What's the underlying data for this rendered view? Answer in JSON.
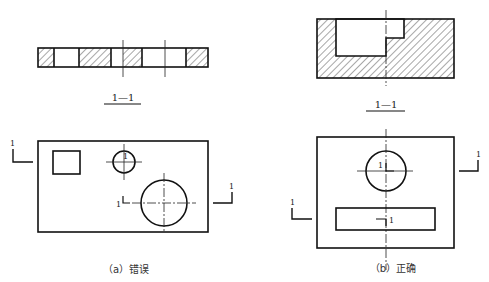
{
  "figure": {
    "top_text_cropped": "",
    "panel_a": {
      "caption": "（a）错误",
      "section_label": "1—1",
      "cut_marks": [
        "1",
        "1",
        "1",
        "1"
      ],
      "verdict": "wrong"
    },
    "panel_b": {
      "caption": "（b）正确",
      "section_label": "1—1",
      "cut_marks": [
        "1",
        "1",
        "1",
        "1"
      ],
      "verdict": "correct"
    }
  },
  "colors": {
    "line": "#111111",
    "background": "#ffffff"
  }
}
